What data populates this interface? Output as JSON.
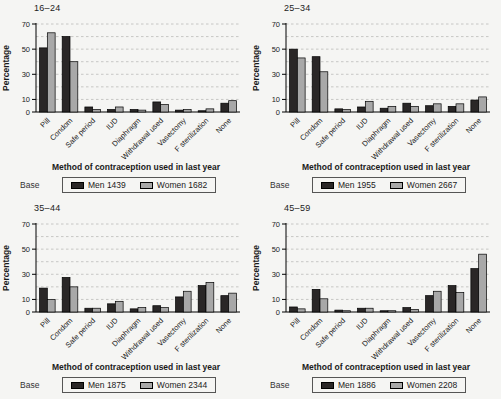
{
  "figure": {
    "ylabel": "Percentage",
    "xlabel": "Method of contraception used in last year",
    "base_label": "Base",
    "background": "#f5f5f3",
    "colors": {
      "men": "#2a2727",
      "women": "#a8a8a8",
      "grid": "#c2c2c0",
      "axis": "#000000",
      "text": "#1a1a1a",
      "legend_border": "#555555"
    }
  },
  "chart_data": [
    {
      "type": "bar",
      "title": "16–24",
      "xlabel": "Method of contraception used in last year",
      "ylabel": "Percentage",
      "ylim": [
        0,
        70
      ],
      "yticks": [
        0,
        10,
        30,
        50,
        70
      ],
      "gridlines_every": 10,
      "grid_style": "dashed",
      "legend_position": "bottom",
      "base_label": "Base",
      "categories": [
        "Pill",
        "Condom",
        "Safe period",
        "IUD",
        "Diaphragm",
        "Withdrawal used",
        "Vasectomy",
        "F sterilization",
        "None"
      ],
      "series": [
        {
          "name": "Men 1439",
          "color": "#2a2727",
          "values": [
            51,
            60,
            4,
            2,
            2,
            8,
            1.5,
            1,
            7
          ]
        },
        {
          "name": "Women 1682",
          "color": "#a8a8a8",
          "values": [
            63,
            40,
            2,
            4,
            1.5,
            6,
            2,
            2.5,
            9
          ]
        }
      ]
    },
    {
      "type": "bar",
      "title": "25–34",
      "xlabel": "Method of contraception used in last year",
      "ylabel": "Percentage",
      "ylim": [
        0,
        70
      ],
      "yticks": [
        0,
        10,
        30,
        50,
        70
      ],
      "gridlines_every": 10,
      "grid_style": "dashed",
      "legend_position": "bottom",
      "base_label": "Base",
      "categories": [
        "Pill",
        "Condom",
        "Safe period",
        "IUD",
        "Diaphragm",
        "Withdrawal used",
        "Vasectomy",
        "F sterilization",
        "None"
      ],
      "series": [
        {
          "name": "Men 1955",
          "color": "#2a2727",
          "values": [
            50,
            44,
            2.5,
            4,
            3,
            7,
            5,
            4.5,
            9.5
          ]
        },
        {
          "name": "Women 2667",
          "color": "#a8a8a8",
          "values": [
            43,
            32,
            2,
            8.5,
            4.5,
            4.5,
            6.5,
            6.5,
            12
          ]
        }
      ]
    },
    {
      "type": "bar",
      "title": "35–44",
      "xlabel": "Method of contraception used in last year",
      "ylabel": "Percentage",
      "ylim": [
        0,
        70
      ],
      "yticks": [
        0,
        10,
        30,
        50,
        70
      ],
      "gridlines_every": 10,
      "grid_style": "dashed",
      "legend_position": "bottom",
      "base_label": "Base",
      "categories": [
        "Pill",
        "Condom",
        "Safe period",
        "IUD",
        "Diaphragm",
        "Withdrawal used",
        "Vasectomy",
        "F sterilization",
        "None"
      ],
      "series": [
        {
          "name": "Men 1875",
          "color": "#2a2727",
          "values": [
            19,
            27.5,
            3,
            6.5,
            2.5,
            5,
            12,
            21,
            13
          ]
        },
        {
          "name": "Women 2344",
          "color": "#a8a8a8",
          "values": [
            10,
            20,
            3,
            8.5,
            3.5,
            3.5,
            16.5,
            23.5,
            15
          ]
        }
      ]
    },
    {
      "type": "bar",
      "title": "45–59",
      "xlabel": "Method of contraception used in last year",
      "ylabel": "Percentage",
      "ylim": [
        0,
        70
      ],
      "yticks": [
        0,
        10,
        30,
        50,
        70
      ],
      "gridlines_every": 10,
      "grid_style": "dashed",
      "legend_position": "bottom",
      "base_label": "Base",
      "categories": [
        "Pill",
        "Condom",
        "Safe period",
        "IUD",
        "Diaphragm",
        "Withdrawal used",
        "Vasectomy",
        "F sterilization",
        "None"
      ],
      "series": [
        {
          "name": "Men 1886",
          "color": "#2a2727",
          "values": [
            4,
            18,
            1.5,
            3,
            1,
            3.5,
            13,
            21,
            34.5
          ]
        },
        {
          "name": "Women 2208",
          "color": "#a8a8a8",
          "values": [
            2.5,
            10.5,
            1,
            3,
            1,
            2,
            16.5,
            15.5,
            46
          ]
        }
      ]
    }
  ]
}
